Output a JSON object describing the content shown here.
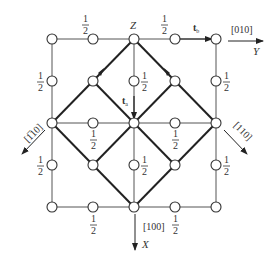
{
  "diagram": {
    "type": "crystal-lattice-projection",
    "colors": {
      "line": "#444444",
      "thick_line": "#222222",
      "atom_fill": "#ffffff",
      "text": "#333333"
    },
    "grid": {
      "x": [
        52,
        93,
        134,
        175,
        216
      ],
      "y": [
        39,
        81,
        123,
        165,
        207
      ]
    },
    "labels": {
      "z_label": "Z",
      "half": "1",
      "half_den": "2",
      "tb": "t",
      "tb_sub": "b",
      "ta": "t",
      "ta_sub": "a",
      "y_dir": "[010]",
      "y_axis": "Y",
      "x_dir": "[100]",
      "x_axis": "X",
      "dir_1bar10": "[1̅10]",
      "dir_110": "[110]"
    }
  }
}
